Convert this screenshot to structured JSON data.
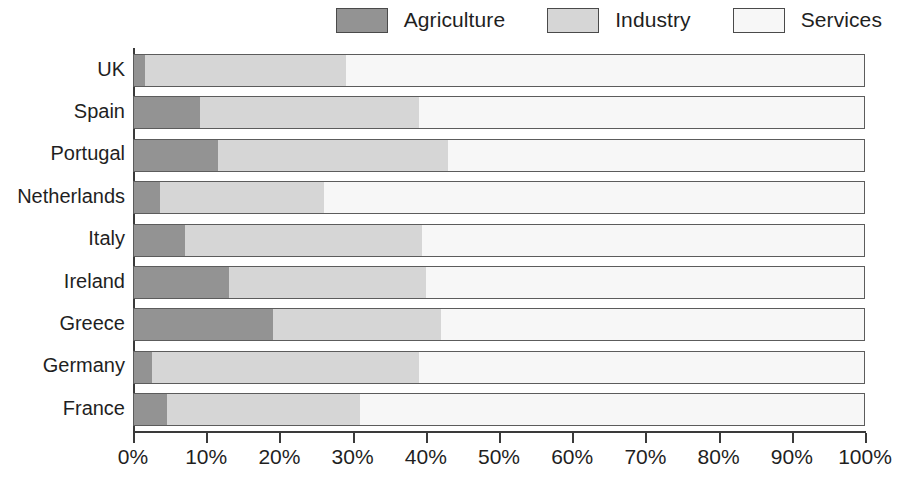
{
  "legend": {
    "items": [
      {
        "label": "Agriculture",
        "color": "#939393",
        "swatch_name": "legend-swatch-agriculture"
      },
      {
        "label": "Industry",
        "color": "#d6d6d6",
        "swatch_name": "legend-swatch-industry"
      },
      {
        "label": "Services",
        "color": "#f7f7f7",
        "swatch_name": "legend-swatch-services"
      }
    ]
  },
  "axis": {
    "x_ticks": [
      "0%",
      "10%",
      "20%",
      "30%",
      "40%",
      "50%",
      "60%",
      "70%",
      "80%",
      "90%",
      "100%"
    ],
    "y_ticks": [
      "UK",
      "Spain",
      "Portugal",
      "Netherlands",
      "Italy",
      "Ireland",
      "Greece",
      "Germany",
      "France"
    ]
  },
  "chart_data": {
    "type": "bar",
    "orientation": "horizontal",
    "stacked": true,
    "normalized": true,
    "title": "",
    "subtitle": "",
    "xlabel": "",
    "ylabel": "",
    "xlim": [
      0,
      100
    ],
    "grid": false,
    "legend_position": "top-right",
    "categories": [
      "UK",
      "Spain",
      "Portugal",
      "Netherlands",
      "Italy",
      "Ireland",
      "Greece",
      "Germany",
      "France"
    ],
    "series": [
      {
        "name": "Agriculture",
        "color": "#939393",
        "values": [
          1.5,
          9,
          11.5,
          3.5,
          7,
          13,
          19,
          2.5,
          4.5
        ]
      },
      {
        "name": "Industry",
        "color": "#d6d6d6",
        "values": [
          27.5,
          30,
          31.5,
          22.5,
          32.5,
          27,
          23,
          36.5,
          26.5
        ]
      },
      {
        "name": "Services",
        "color": "#f7f7f7",
        "values": [
          71,
          61,
          57,
          74,
          60.5,
          60,
          58,
          61,
          69
        ]
      }
    ],
    "tick_labels_x": [
      "0%",
      "10%",
      "20%",
      "30%",
      "40%",
      "50%",
      "60%",
      "70%",
      "80%",
      "90%",
      "100%"
    ]
  }
}
